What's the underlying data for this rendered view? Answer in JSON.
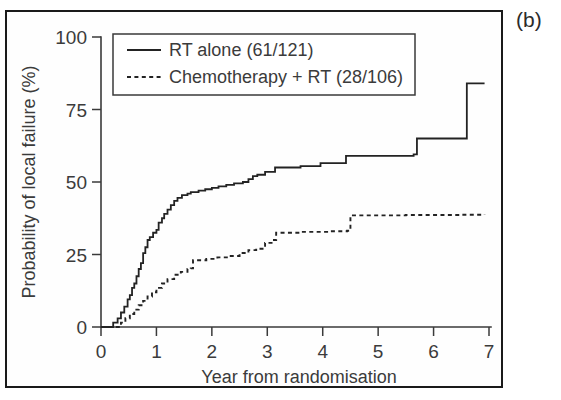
{
  "panel": {
    "label": "(b)"
  },
  "chart_data": {
    "type": "line",
    "title": "",
    "subtitle": "",
    "xlabel": "Year from randomisation",
    "ylabel": "Probability of local failure (%)",
    "xlim": [
      0,
      7
    ],
    "ylim": [
      0,
      100
    ],
    "xticks": [
      0,
      1,
      2,
      3,
      4,
      5,
      6,
      7
    ],
    "xticklabels": [
      "0",
      "1",
      "2",
      "3",
      "4",
      "5",
      "6",
      "7"
    ],
    "yticks": [
      0,
      25,
      50,
      75,
      100
    ],
    "yticklabels": [
      "0",
      "25",
      "50",
      "75",
      "100"
    ],
    "grid": false,
    "legend_position": "upper-left",
    "style": "kaplan-meier-step",
    "series": [
      {
        "name": "RT alone (61/121)",
        "linestyle": "solid",
        "color": "#232323",
        "events": "61",
        "total": "121",
        "points": [
          [
            0.0,
            0
          ],
          [
            0.18,
            0
          ],
          [
            0.22,
            1.5
          ],
          [
            0.3,
            3.0
          ],
          [
            0.36,
            5.0
          ],
          [
            0.42,
            7.0
          ],
          [
            0.48,
            9.5
          ],
          [
            0.52,
            11.0
          ],
          [
            0.56,
            13.5
          ],
          [
            0.6,
            15.0
          ],
          [
            0.64,
            17.5
          ],
          [
            0.68,
            20.0
          ],
          [
            0.72,
            22.0
          ],
          [
            0.76,
            25.5
          ],
          [
            0.8,
            27.5
          ],
          [
            0.84,
            30.0
          ],
          [
            0.88,
            31.0
          ],
          [
            0.94,
            32.5
          ],
          [
            1.0,
            33.5
          ],
          [
            1.04,
            36.0
          ],
          [
            1.1,
            37.5
          ],
          [
            1.14,
            39.0
          ],
          [
            1.2,
            40.5
          ],
          [
            1.26,
            42.0
          ],
          [
            1.32,
            43.5
          ],
          [
            1.38,
            44.5
          ],
          [
            1.46,
            45.5
          ],
          [
            1.56,
            46.0
          ],
          [
            1.62,
            46.5
          ],
          [
            1.76,
            47.0
          ],
          [
            1.88,
            47.5
          ],
          [
            2.0,
            48.0
          ],
          [
            2.12,
            48.5
          ],
          [
            2.26,
            49.0
          ],
          [
            2.4,
            49.5
          ],
          [
            2.56,
            50.0
          ],
          [
            2.66,
            51.0
          ],
          [
            2.74,
            52.0
          ],
          [
            2.82,
            52.5
          ],
          [
            2.96,
            53.5
          ],
          [
            3.14,
            55.0
          ],
          [
            3.6,
            55.5
          ],
          [
            3.96,
            56.5
          ],
          [
            4.42,
            59.0
          ],
          [
            5.64,
            59.5
          ],
          [
            5.7,
            65.0
          ],
          [
            6.56,
            65.0
          ],
          [
            6.6,
            84.0
          ],
          [
            6.92,
            84.0
          ]
        ]
      },
      {
        "name": "Chemotherapy + RT (28/106)",
        "linestyle": "dashed",
        "color": "#232323",
        "events": "28",
        "total": "106",
        "points": [
          [
            0.0,
            0
          ],
          [
            0.3,
            0
          ],
          [
            0.36,
            1.5
          ],
          [
            0.44,
            3.0
          ],
          [
            0.52,
            4.5
          ],
          [
            0.6,
            6.0
          ],
          [
            0.68,
            7.5
          ],
          [
            0.76,
            9.0
          ],
          [
            0.84,
            10.5
          ],
          [
            0.92,
            12.0
          ],
          [
            1.0,
            13.5
          ],
          [
            1.1,
            15.0
          ],
          [
            1.2,
            16.5
          ],
          [
            1.32,
            18.0
          ],
          [
            1.44,
            19.0
          ],
          [
            1.56,
            20.0
          ],
          [
            1.62,
            20.2
          ],
          [
            1.66,
            23.0
          ],
          [
            1.9,
            23.5
          ],
          [
            2.1,
            24.0
          ],
          [
            2.3,
            24.5
          ],
          [
            2.5,
            25.5
          ],
          [
            2.66,
            26.5
          ],
          [
            2.8,
            27.0
          ],
          [
            2.96,
            29.0
          ],
          [
            3.1,
            30.0
          ],
          [
            3.16,
            32.5
          ],
          [
            3.6,
            32.8
          ],
          [
            4.1,
            33.0
          ],
          [
            4.44,
            33.2
          ],
          [
            4.5,
            38.5
          ],
          [
            5.5,
            38.6
          ],
          [
            6.5,
            38.7
          ],
          [
            6.92,
            38.8
          ]
        ]
      }
    ]
  },
  "legend": {
    "entries": [
      {
        "label": "RT alone (61/121)",
        "style": "solid"
      },
      {
        "label": "Chemotherapy + RT (28/106)",
        "style": "dashed"
      }
    ]
  }
}
